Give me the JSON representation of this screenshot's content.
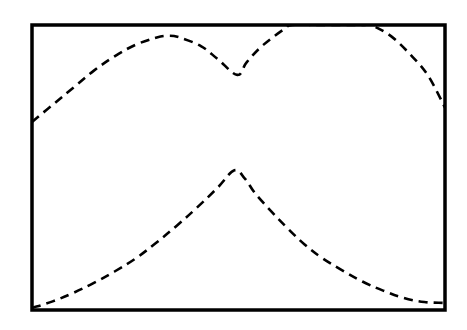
{
  "chart_data": {
    "type": "line",
    "title": "",
    "xlabel": "",
    "ylabel": "",
    "grid": false,
    "legend": null,
    "frame": {
      "x": 32,
      "y": 25,
      "width": 413,
      "height": 285,
      "stroke": "#000000",
      "stroke_width": 3.5
    },
    "note": "No axis ticks, tick labels, legend or annotations are rendered. Values below are in normalized plot coordinates: x in [0,1] left→right, y in [0,1] bottom→top of the frame. Upper curve is clipped by the top of the frame.",
    "xlim": [
      0,
      1
    ],
    "ylim": [
      0,
      1
    ],
    "series": [
      {
        "name": "upper-curve",
        "style": "dashed",
        "color": "#000000",
        "dash": [
          9,
          6
        ],
        "shape": "two humps with a sharp cusp (V-shaped dip) near x≈0.5; second hump exceeds the frame top",
        "points": [
          [
            0.0,
            0.66
          ],
          [
            0.05,
            0.72
          ],
          [
            0.1,
            0.78
          ],
          [
            0.15,
            0.84
          ],
          [
            0.2,
            0.89
          ],
          [
            0.25,
            0.93
          ],
          [
            0.3,
            0.955
          ],
          [
            0.33,
            0.962
          ],
          [
            0.36,
            0.955
          ],
          [
            0.41,
            0.925
          ],
          [
            0.45,
            0.88
          ],
          [
            0.497,
            0.825
          ],
          [
            0.52,
            0.87
          ],
          [
            0.56,
            0.93
          ],
          [
            0.61,
            0.985
          ],
          [
            0.63,
            1.0
          ],
          [
            0.7,
            1.0
          ],
          [
            0.8,
            1.0
          ],
          [
            0.82,
            1.0
          ],
          [
            0.87,
            0.96
          ],
          [
            0.92,
            0.89
          ],
          [
            0.96,
            0.82
          ],
          [
            1.0,
            0.71
          ]
        ]
      },
      {
        "name": "lower-curve",
        "style": "dashed",
        "color": "#000000",
        "dash": [
          9,
          6
        ],
        "shape": "sharp cusp peak near x≈0.52, rising convexly from lower left and decaying toward lower right",
        "points": [
          [
            0.0,
            0.007
          ],
          [
            0.05,
            0.03
          ],
          [
            0.1,
            0.06
          ],
          [
            0.15,
            0.095
          ],
          [
            0.2,
            0.135
          ],
          [
            0.25,
            0.18
          ],
          [
            0.3,
            0.235
          ],
          [
            0.35,
            0.295
          ],
          [
            0.4,
            0.36
          ],
          [
            0.45,
            0.43
          ],
          [
            0.49,
            0.49
          ],
          [
            0.516,
            0.46
          ],
          [
            0.54,
            0.41
          ],
          [
            0.58,
            0.345
          ],
          [
            0.62,
            0.285
          ],
          [
            0.66,
            0.23
          ],
          [
            0.7,
            0.185
          ],
          [
            0.75,
            0.14
          ],
          [
            0.8,
            0.1
          ],
          [
            0.85,
            0.068
          ],
          [
            0.9,
            0.042
          ],
          [
            0.95,
            0.028
          ],
          [
            0.995,
            0.025
          ]
        ]
      }
    ]
  }
}
